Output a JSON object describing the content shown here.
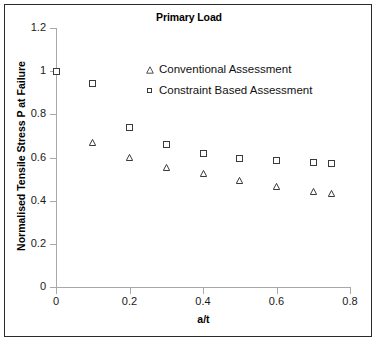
{
  "chart_data": {
    "type": "scatter",
    "title": "Primary Load",
    "xlabel": "a/t",
    "ylabel": "Normalised Tensile Stress P at Failure",
    "xlim": [
      0,
      0.8
    ],
    "ylim": [
      0,
      1.2
    ],
    "xticks": [
      "0",
      "0.2",
      "0.4",
      "0.6",
      "0.8"
    ],
    "xtick_values": [
      0,
      0.2,
      0.4,
      0.6,
      0.8
    ],
    "yticks": [
      "0",
      "0.2",
      "0.4",
      "0.6",
      "0.8",
      "1",
      "1.2"
    ],
    "ytick_values": [
      0,
      0.2,
      0.4,
      0.6,
      0.8,
      1,
      1.2
    ],
    "grid": false,
    "legend_position": "inside-top-center",
    "series": [
      {
        "name": "Conventional Assessment",
        "marker": "triangle-open",
        "color": "#3a3a3a",
        "x": [
          0,
          0.1,
          0.2,
          0.3,
          0.4,
          0.5,
          0.6,
          0.7,
          0.75
        ],
        "y": [
          1.0,
          0.67,
          0.6,
          0.555,
          0.525,
          0.495,
          0.465,
          0.443,
          0.433
        ]
      },
      {
        "name": "Constraint Based Assessment",
        "marker": "square-open",
        "color": "#3a3a3a",
        "x": [
          0,
          0.1,
          0.2,
          0.3,
          0.4,
          0.5,
          0.6,
          0.7,
          0.75
        ],
        "y": [
          1.0,
          0.945,
          0.74,
          0.66,
          0.62,
          0.597,
          0.585,
          0.578,
          0.572
        ]
      }
    ]
  },
  "legend": {
    "entries": [
      {
        "label": "Conventional Assessment",
        "symbol": "triangle-open-icon"
      },
      {
        "label": "Constraint Based Assessment",
        "symbol": "square-open-icon"
      }
    ]
  },
  "colors": {
    "marker_stroke": "#3a3a3a",
    "axis": "#a8a8a8",
    "text": "#111111",
    "frame": "#2a2a2a",
    "background": "#ffffff"
  }
}
